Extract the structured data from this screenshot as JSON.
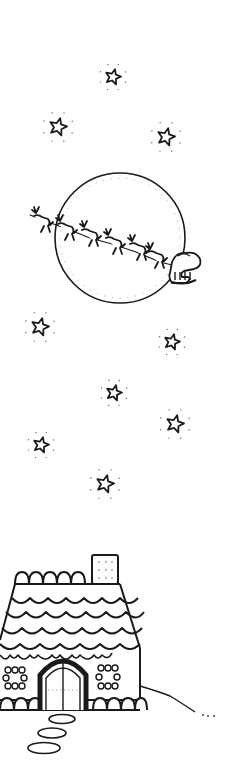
{
  "illustration": {
    "title": "Santa's sleigh crossing the moon above a gingerbread house",
    "background": "#ffffff",
    "ink_color": "#1a1a1a",
    "stars": [
      {
        "x": 113,
        "y": 77,
        "r": 8
      },
      {
        "x": 58,
        "y": 127,
        "r": 9
      },
      {
        "x": 166,
        "y": 137,
        "r": 9
      },
      {
        "x": 40,
        "y": 327,
        "r": 9
      },
      {
        "x": 172,
        "y": 342,
        "r": 8
      },
      {
        "x": 114,
        "y": 393,
        "r": 8
      },
      {
        "x": 175,
        "y": 424,
        "r": 9
      },
      {
        "x": 41,
        "y": 445,
        "r": 8
      },
      {
        "x": 105,
        "y": 484,
        "r": 9
      }
    ],
    "moon": {
      "cx": 120,
      "cy": 238,
      "r": 65
    },
    "reindeer_count": 6,
    "house": {
      "chimney": true,
      "windows": 2,
      "door": "arched double door",
      "path_stones": 3
    }
  }
}
